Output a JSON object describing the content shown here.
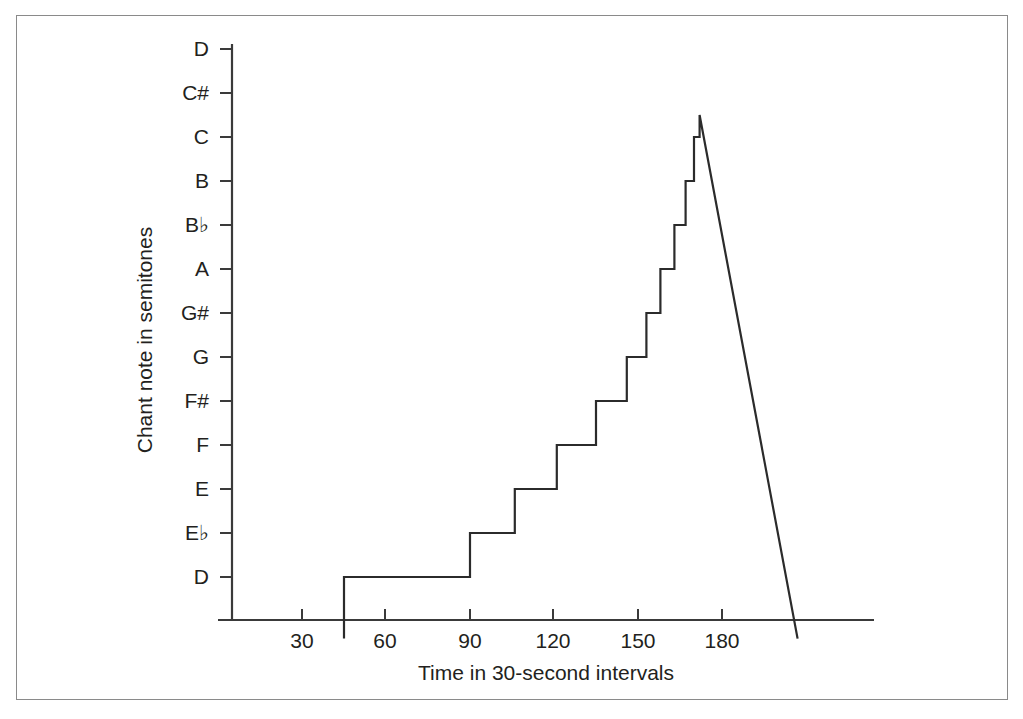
{
  "figure": {
    "frame_visible": true,
    "background_color": "#ffffff",
    "line_color": "#2b2b2b"
  },
  "chart_data": {
    "type": "line",
    "title": "",
    "subtitle": "",
    "xlabel": "Time in 30-second intervals",
    "ylabel": "Chant note in semitones",
    "grid": false,
    "legend": "none",
    "x_ticks": [
      30,
      60,
      90,
      120,
      150,
      180
    ],
    "x_tick_labels": [
      "30",
      "60",
      "90",
      "120",
      "150",
      "180"
    ],
    "xlim": [
      10,
      215
    ],
    "y_tick_labels": [
      "D",
      "E♭",
      "E",
      "F",
      "F#",
      "G",
      "G#",
      "A",
      "B♭",
      "B",
      "C",
      "C#",
      "D"
    ],
    "y_tick_values": [
      0,
      1,
      2,
      3,
      4,
      5,
      6,
      7,
      8,
      9,
      10,
      11,
      12
    ],
    "ylim": [
      -1.4,
      12.0
    ],
    "series": [
      {
        "name": "chant pitch",
        "style": "step-then-linear-decay",
        "points": [
          {
            "x": 45,
            "y": -1.4
          },
          {
            "x": 45,
            "y": 0
          },
          {
            "x": 90,
            "y": 0
          },
          {
            "x": 90,
            "y": 1
          },
          {
            "x": 106,
            "y": 1
          },
          {
            "x": 106,
            "y": 2
          },
          {
            "x": 121,
            "y": 2
          },
          {
            "x": 121,
            "y": 3
          },
          {
            "x": 135,
            "y": 3
          },
          {
            "x": 135,
            "y": 4
          },
          {
            "x": 146,
            "y": 4
          },
          {
            "x": 146,
            "y": 5
          },
          {
            "x": 153,
            "y": 5
          },
          {
            "x": 153,
            "y": 6
          },
          {
            "x": 158,
            "y": 6
          },
          {
            "x": 158,
            "y": 7
          },
          {
            "x": 163,
            "y": 7
          },
          {
            "x": 163,
            "y": 8
          },
          {
            "x": 167,
            "y": 8
          },
          {
            "x": 167,
            "y": 9
          },
          {
            "x": 170,
            "y": 9
          },
          {
            "x": 170,
            "y": 10
          },
          {
            "x": 172,
            "y": 10
          },
          {
            "x": 172,
            "y": 10.5
          },
          {
            "x": 207,
            "y": -1.4
          }
        ]
      }
    ]
  }
}
